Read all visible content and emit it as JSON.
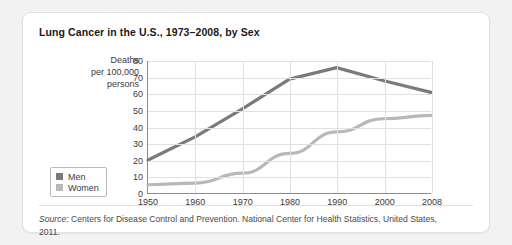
{
  "card": {
    "title": "Lung Cancer in the U.S., 1973–2008, by Sex",
    "source_prefix": "Source:",
    "source_text": " Centers for Disease Control and Prevention. National Center for Health Statistics, United States, 2011."
  },
  "legend": {
    "items": [
      {
        "label": "Men",
        "color": "#7a7a7a"
      },
      {
        "label": "Women",
        "color": "#b8b8b8"
      }
    ]
  },
  "chart_data": {
    "type": "line",
    "title": "Lung Cancer in the U.S., 1973–2008, by Sex",
    "xlabel": "",
    "ylabel": "Deaths per 100,000 persons",
    "ylabel_lines": [
      "Deaths",
      "per 100,000",
      "persons"
    ],
    "categories": [
      "1950",
      "1960",
      "1970",
      "1980",
      "1990",
      "2000",
      "2008"
    ],
    "xticks": [
      "1950",
      "1960",
      "1970",
      "1980",
      "1990",
      "2000",
      "2008"
    ],
    "yticks": [
      "0",
      "10",
      "20",
      "30",
      "40",
      "50",
      "60",
      "70",
      "80"
    ],
    "ylim": [
      0,
      80
    ],
    "grid": true,
    "legend_position": "left-outside",
    "series": [
      {
        "name": "Men",
        "color": "#7a7a7a",
        "values": [
          20,
          34,
          51,
          69,
          76,
          68,
          61
        ]
      },
      {
        "name": "Women",
        "color": "#b8b8b8",
        "values": [
          5,
          6,
          12,
          24,
          37,
          45,
          47
        ]
      }
    ]
  }
}
